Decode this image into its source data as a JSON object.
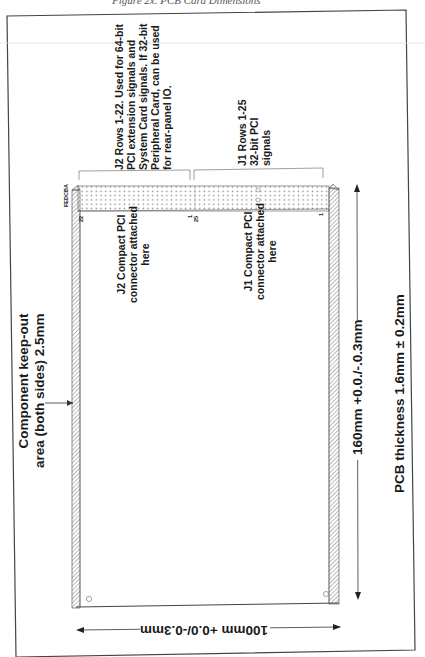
{
  "caption": "Figure 2x. PCB Card Dimensions",
  "connectors": {
    "j2_region_label": "J2 Rows 1-22. Used for 64-bit\nPCI extension signals and\nSystem Card signals. If 32-bit\nPeripheral Card, can be used\nfor rear-panel IO.",
    "j1_region_label": "J1 Rows 1-25\n32-bit PCI\nsignals",
    "j2_attach_label": "J2 Compact PCI\nconnector attached\nhere",
    "j1_attach_label": "J1 Compact PCI\nconnector attached\nhere",
    "column_letters": "FEDCBA",
    "j2_pin_start": "22",
    "j2_pin_end": "1",
    "j1_pin_start": "25",
    "j1_pin_end": "1"
  },
  "annotations": {
    "keepout_label": "Component keep-out\narea (both sides) 2.5mm",
    "length_dimension": "160mm +0.0./-.0.3mm",
    "width_dimension": "100mm +0.0/-0.3mm",
    "thickness_label": "PCB thickness 1.6mm ± 0.2mm"
  },
  "colors": {
    "line": "#333333",
    "hatch": "#555555",
    "frame": "#444444"
  }
}
